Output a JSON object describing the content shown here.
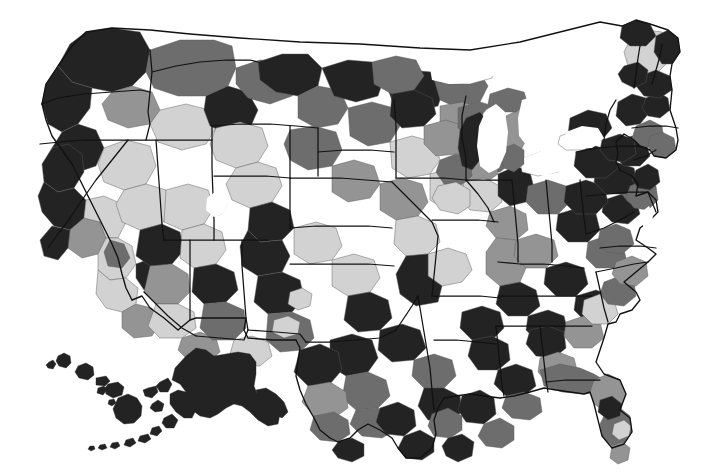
{
  "figure": {
    "kind": "choropleth-map",
    "region": "United States",
    "title": "",
    "subtitle": "",
    "caption": "",
    "background_color": "#ffffff",
    "has_legend": false,
    "has_title": false,
    "has_axis": false,
    "insets": [
      "Alaska",
      "Hawaii"
    ]
  },
  "chart_data": {
    "type": "heatmap",
    "title": "",
    "xlabel": "",
    "ylabel": "",
    "map_projection": "albers-usa",
    "geography_level": "county / commuting zone",
    "color_scheme": "grayscale-sequential",
    "legend_position": "none",
    "grid": false,
    "classes": [
      {
        "id": "q1",
        "label": "",
        "color": "#d2d2d2",
        "rank": 1
      },
      {
        "id": "q2",
        "label": "",
        "color": "#949494",
        "rank": 2
      },
      {
        "id": "q3",
        "label": "",
        "color": "#6d6d6d",
        "rank": 3
      },
      {
        "id": "q4",
        "label": "",
        "color": "#232323",
        "rank": 4
      }
    ],
    "water_color": "#ffffff",
    "boundary_color": "#111111",
    "unit_boundary_color": "#5a5a5a",
    "regions": [
      {
        "name": "Washington",
        "class": "q4"
      },
      {
        "name": "Oregon",
        "class": "q4"
      },
      {
        "name": "California-north",
        "class": "q4"
      },
      {
        "name": "California-central",
        "class": "q1"
      },
      {
        "name": "California-south",
        "class": "q2"
      },
      {
        "name": "Idaho",
        "class": "q1"
      },
      {
        "name": "Nevada",
        "class": "q1"
      },
      {
        "name": "Utah",
        "class": "q1"
      },
      {
        "name": "Arizona",
        "class": "q2"
      },
      {
        "name": "Montana",
        "class": "q3"
      },
      {
        "name": "Wyoming",
        "class": "q3"
      },
      {
        "name": "Colorado",
        "class": "q2"
      },
      {
        "name": "New Mexico",
        "class": "q3"
      },
      {
        "name": "North Dakota",
        "class": "q1"
      },
      {
        "name": "South Dakota",
        "class": "q1"
      },
      {
        "name": "Nebraska",
        "class": "q1"
      },
      {
        "name": "Kansas",
        "class": "q1"
      },
      {
        "name": "Oklahoma",
        "class": "q4"
      },
      {
        "name": "Texas",
        "class": "q4"
      },
      {
        "name": "Minnesota",
        "class": "q3"
      },
      {
        "name": "Iowa",
        "class": "q2"
      },
      {
        "name": "Missouri",
        "class": "q4"
      },
      {
        "name": "Arkansas",
        "class": "q4"
      },
      {
        "name": "Louisiana",
        "class": "q4"
      },
      {
        "name": "Wisconsin",
        "class": "q3"
      },
      {
        "name": "Illinois",
        "class": "q2"
      },
      {
        "name": "Michigan",
        "class": "q4"
      },
      {
        "name": "Indiana",
        "class": "q3"
      },
      {
        "name": "Ohio",
        "class": "q3"
      },
      {
        "name": "Kentucky",
        "class": "q4"
      },
      {
        "name": "Tennessee",
        "class": "q4"
      },
      {
        "name": "Mississippi",
        "class": "q4"
      },
      {
        "name": "Alabama",
        "class": "q4"
      },
      {
        "name": "Georgia",
        "class": "q2"
      },
      {
        "name": "Florida",
        "class": "q3"
      },
      {
        "name": "South Carolina",
        "class": "q2"
      },
      {
        "name": "North Carolina",
        "class": "q3"
      },
      {
        "name": "Virginia",
        "class": "q3"
      },
      {
        "name": "West Virginia",
        "class": "q4"
      },
      {
        "name": "Maryland",
        "class": "q3"
      },
      {
        "name": "Delaware",
        "class": "q3"
      },
      {
        "name": "Pennsylvania",
        "class": "q4"
      },
      {
        "name": "New Jersey",
        "class": "q4"
      },
      {
        "name": "New York",
        "class": "q4"
      },
      {
        "name": "Connecticut",
        "class": "q4"
      },
      {
        "name": "Rhode Island",
        "class": "q3"
      },
      {
        "name": "Massachusetts",
        "class": "q3"
      },
      {
        "name": "Vermont",
        "class": "q4"
      },
      {
        "name": "New Hampshire",
        "class": "q4"
      },
      {
        "name": "Maine",
        "class": "q1"
      },
      {
        "name": "Alaska",
        "class": "q4"
      },
      {
        "name": "Hawaii",
        "class": "q4"
      }
    ],
    "water_bodies": [
      "Lake Michigan",
      "Lake Erie",
      "Lake Ontario",
      "Lake Huron",
      "Great Salt Lake"
    ]
  }
}
